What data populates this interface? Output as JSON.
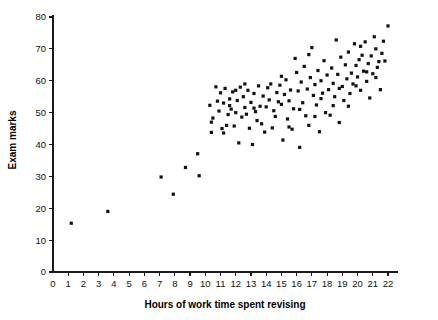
{
  "chart_data": {
    "type": "scatter",
    "title": "",
    "xlabel": "Hours of work time spent revising",
    "ylabel": "Exam marks",
    "xlim": [
      0,
      22.8
    ],
    "ylim": [
      0,
      80
    ],
    "xticks": [
      0,
      1,
      2,
      3,
      4,
      5,
      6,
      7,
      8,
      9,
      10,
      11,
      12,
      13,
      14,
      15,
      16,
      17,
      18,
      19,
      20,
      21,
      22
    ],
    "yticks": [
      0,
      10,
      20,
      30,
      40,
      50,
      60,
      70,
      80
    ],
    "grid": false,
    "legend": null,
    "marker": "filled-square",
    "marker_color": "#111111",
    "marker_size_px": 3.2,
    "series": [
      {
        "name": "students",
        "points": [
          [
            1.2,
            15.3
          ],
          [
            3.6,
            19.0
          ],
          [
            7.1,
            29.8
          ],
          [
            7.9,
            24.4
          ],
          [
            8.7,
            32.8
          ],
          [
            9.5,
            37.1
          ],
          [
            9.6,
            30.2
          ],
          [
            10.3,
            52.3
          ],
          [
            10.4,
            47.0
          ],
          [
            10.4,
            43.8
          ],
          [
            10.5,
            48.3
          ],
          [
            10.7,
            58.1
          ],
          [
            10.9,
            50.5
          ],
          [
            11.0,
            56.2
          ],
          [
            11.1,
            45.0
          ],
          [
            11.2,
            53.0
          ],
          [
            11.3,
            57.6
          ],
          [
            11.4,
            46.0
          ],
          [
            11.5,
            49.4
          ],
          [
            11.6,
            54.3
          ],
          [
            11.7,
            51.1
          ],
          [
            11.8,
            56.5
          ],
          [
            11.9,
            45.8
          ],
          [
            12.0,
            50.0
          ],
          [
            12.1,
            53.8
          ],
          [
            12.2,
            40.5
          ],
          [
            12.3,
            58.0
          ],
          [
            12.4,
            48.6
          ],
          [
            12.5,
            55.0
          ],
          [
            12.6,
            51.6
          ],
          [
            12.7,
            49.5
          ],
          [
            12.8,
            57.0
          ],
          [
            12.9,
            45.1
          ],
          [
            13.0,
            53.2
          ],
          [
            13.1,
            40.0
          ],
          [
            13.2,
            56.0
          ],
          [
            13.3,
            50.3
          ],
          [
            13.4,
            47.5
          ],
          [
            13.5,
            58.4
          ],
          [
            13.6,
            52.0
          ],
          [
            13.8,
            55.2
          ],
          [
            13.9,
            43.9
          ],
          [
            14.0,
            51.8
          ],
          [
            14.1,
            57.8
          ],
          [
            14.2,
            54.0
          ],
          [
            14.3,
            59.0
          ],
          [
            14.5,
            50.6
          ],
          [
            14.7,
            56.3
          ],
          [
            14.8,
            53.4
          ],
          [
            14.9,
            58.6
          ],
          [
            15.0,
            52.6
          ],
          [
            15.1,
            41.4
          ],
          [
            15.2,
            55.7
          ],
          [
            15.3,
            60.3
          ],
          [
            15.4,
            48.0
          ],
          [
            15.5,
            53.7
          ],
          [
            15.6,
            57.1
          ],
          [
            15.7,
            44.8
          ],
          [
            15.8,
            51.2
          ],
          [
            15.9,
            67.0
          ],
          [
            16.0,
            62.6
          ],
          [
            16.1,
            56.8
          ],
          [
            16.2,
            39.1
          ],
          [
            16.3,
            59.6
          ],
          [
            16.4,
            53.1
          ],
          [
            16.5,
            64.5
          ],
          [
            16.6,
            49.0
          ],
          [
            16.7,
            57.4
          ],
          [
            16.8,
            46.0
          ],
          [
            16.9,
            61.0
          ],
          [
            17.0,
            70.4
          ],
          [
            17.1,
            55.4
          ],
          [
            17.2,
            58.8
          ],
          [
            17.3,
            52.4
          ],
          [
            17.4,
            63.2
          ],
          [
            17.5,
            44.0
          ],
          [
            17.6,
            60.0
          ],
          [
            17.7,
            56.1
          ],
          [
            17.8,
            66.3
          ],
          [
            17.9,
            50.0
          ],
          [
            18.0,
            61.8
          ],
          [
            18.1,
            57.2
          ],
          [
            18.2,
            49.2
          ],
          [
            18.3,
            64.0
          ],
          [
            18.4,
            59.2
          ],
          [
            18.5,
            55.0
          ],
          [
            18.6,
            72.8
          ],
          [
            18.7,
            62.0
          ],
          [
            18.8,
            46.9
          ],
          [
            18.9,
            67.4
          ],
          [
            19.0,
            58.2
          ],
          [
            19.1,
            53.8
          ],
          [
            19.2,
            65.0
          ],
          [
            19.3,
            60.6
          ],
          [
            19.4,
            69.0
          ],
          [
            19.5,
            56.0
          ],
          [
            19.6,
            62.4
          ],
          [
            19.7,
            59.0
          ],
          [
            19.8,
            71.6
          ],
          [
            19.9,
            64.8
          ],
          [
            20.0,
            61.2
          ],
          [
            20.1,
            66.6
          ],
          [
            20.2,
            57.0
          ],
          [
            20.3,
            68.0
          ],
          [
            20.4,
            63.0
          ],
          [
            20.5,
            72.2
          ],
          [
            20.6,
            59.8
          ],
          [
            20.7,
            65.4
          ],
          [
            20.8,
            54.6
          ],
          [
            20.9,
            67.8
          ],
          [
            21.0,
            62.2
          ],
          [
            21.1,
            73.8
          ],
          [
            21.2,
            70.0
          ],
          [
            21.3,
            64.2
          ],
          [
            21.4,
            66.0
          ],
          [
            21.5,
            57.2
          ],
          [
            21.6,
            68.6
          ],
          [
            21.7,
            72.4
          ],
          [
            21.8,
            66.2
          ],
          [
            22.0,
            77.2
          ],
          [
            15.5,
            45.5
          ],
          [
            16.2,
            51.0
          ],
          [
            13.7,
            46.5
          ],
          [
            12.6,
            59.0
          ],
          [
            11.2,
            43.6
          ],
          [
            10.8,
            53.6
          ],
          [
            14.4,
            45.2
          ],
          [
            17.2,
            48.8
          ],
          [
            18.8,
            57.6
          ],
          [
            20.2,
            70.8
          ],
          [
            19.4,
            52.0
          ],
          [
            16.8,
            68.2
          ],
          [
            15.0,
            61.4
          ],
          [
            13.2,
            51.4
          ],
          [
            12.0,
            57.0
          ],
          [
            19.9,
            58.4
          ],
          [
            20.6,
            62.8
          ],
          [
            21.2,
            61.0
          ],
          [
            17.6,
            54.4
          ],
          [
            18.4,
            52.2
          ],
          [
            14.6,
            48.8
          ],
          [
            11.6,
            52.2
          ]
        ]
      }
    ]
  }
}
